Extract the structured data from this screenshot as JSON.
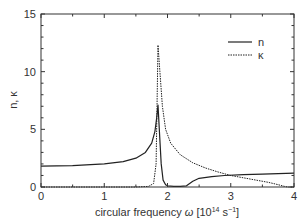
{
  "chart_data": {
    "type": "line",
    "title": "",
    "xlabel": "circular frequency ω [10¹⁴ s⁻¹]",
    "ylabel": "n, κ",
    "xlim": [
      0,
      4
    ],
    "ylim": [
      0,
      15
    ],
    "x_ticks": [
      "0",
      "1",
      "2",
      "3",
      "4"
    ],
    "y_ticks": [
      "0",
      "5",
      "10",
      "15"
    ],
    "grid": false,
    "legend_position": "upper right",
    "series": [
      {
        "name": "n",
        "style": "solid",
        "x": [
          0,
          0.5,
          1.0,
          1.3,
          1.5,
          1.65,
          1.75,
          1.8,
          1.83,
          1.85,
          1.87,
          1.9,
          1.93,
          1.97,
          2.0,
          2.1,
          2.2,
          2.3,
          2.4,
          2.5,
          2.7,
          2.9,
          3.2,
          3.5,
          4.0
        ],
        "y": [
          1.8,
          1.85,
          2.0,
          2.2,
          2.5,
          3.0,
          3.8,
          4.8,
          6.0,
          7.1,
          5.0,
          2.0,
          0.6,
          0.2,
          0.1,
          0.05,
          0.05,
          0.1,
          0.5,
          0.75,
          0.9,
          1.0,
          1.07,
          1.12,
          1.2
        ]
      },
      {
        "name": "κ",
        "style": "dashed",
        "x": [
          0,
          1.0,
          1.5,
          1.7,
          1.78,
          1.82,
          1.85,
          1.88,
          1.92,
          1.97,
          2.05,
          2.2,
          2.4,
          2.6,
          2.8,
          3.0,
          3.2,
          3.4,
          3.6,
          3.75,
          3.85,
          3.9,
          4.0
        ],
        "y": [
          0.0,
          0.0,
          0.0,
          0.05,
          0.3,
          2.0,
          12.3,
          10.0,
          7.0,
          5.0,
          3.8,
          2.8,
          2.1,
          1.65,
          1.3,
          1.0,
          0.8,
          0.6,
          0.4,
          0.2,
          0.05,
          0.0,
          0.0
        ]
      }
    ]
  },
  "legend": {
    "items": [
      {
        "label": "n",
        "style": "solid"
      },
      {
        "label": "κ",
        "style": "dashed"
      }
    ]
  },
  "axes": {
    "xlabel_prefix": "circular frequency ",
    "xlabel_symbol": "ω",
    "xlabel_unit_open": " [10",
    "xlabel_exp1": "14",
    "xlabel_unit_mid": " s",
    "xlabel_exp2": "−1",
    "xlabel_unit_close": "]",
    "ylabel": "n, κ"
  },
  "colors": {
    "line": "#222222",
    "frame": "#333333"
  }
}
